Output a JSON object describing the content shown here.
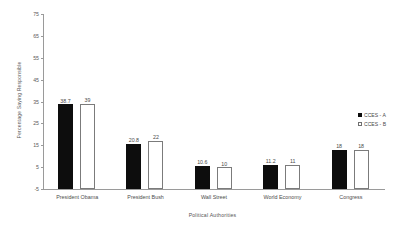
{
  "chart_data": {
    "type": "bar",
    "title": "",
    "xlabel": "Political Authorities",
    "ylabel": "Percentage Saying Responsible",
    "categories": [
      "President Obama",
      "President Bush",
      "Wall Street",
      "World Economy",
      "Congress"
    ],
    "series": [
      {
        "name": "CCES - A",
        "color": "#0d0d0d",
        "fill": "solid",
        "values": [
          38.7,
          20.8,
          10.6,
          11.2,
          18
        ]
      },
      {
        "name": "CCES - B",
        "color": "#ffffff",
        "fill": "hollow",
        "values": [
          39,
          22,
          10,
          11,
          18
        ]
      }
    ],
    "value_labels": {
      "series_a": [
        "38.7",
        "20.8",
        "10.6",
        "11.2",
        "18"
      ],
      "series_b": [
        "39",
        "22",
        "10",
        "11",
        "18"
      ]
    },
    "ylim": [
      -5,
      75
    ],
    "ytick_values": [
      75,
      65,
      55,
      45,
      35,
      25,
      15,
      5,
      -5
    ],
    "ytick_labels": [
      "75",
      "65",
      "55",
      "45",
      "35",
      "25",
      "15",
      "5",
      "-5"
    ],
    "grid": false,
    "legend_position": "right"
  },
  "legend": {
    "entries": [
      {
        "label": "CCES - A"
      },
      {
        "label": "CCES - B"
      }
    ]
  }
}
